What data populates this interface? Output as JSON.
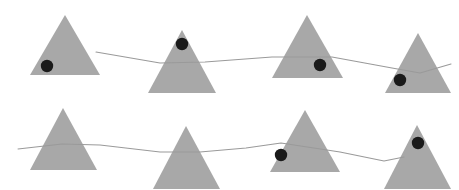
{
  "figure": {
    "title": "Triangles with path overlay",
    "width": 459,
    "height": 190,
    "background_color": "#ffffff"
  },
  "style": {
    "triangle_fill": "#a8a8a8",
    "triangle_stroke": "none",
    "dot_fill": "#1a1a1a",
    "path_stroke": "#9a9a9a",
    "path_width": 1.1,
    "dot_radius": 6.2
  },
  "shapes": {
    "triangles": [
      {
        "name": "triangle-row1-1",
        "row": 1,
        "index": 1,
        "apex_x": 65,
        "apex_y": 15,
        "base_left_x": 30,
        "base_right_x": 100,
        "base_y": 75
      },
      {
        "name": "triangle-row1-2",
        "row": 1,
        "index": 2,
        "apex_x": 182,
        "apex_y": 30,
        "base_left_x": 148,
        "base_right_x": 216,
        "base_y": 93
      },
      {
        "name": "triangle-row1-3",
        "row": 1,
        "index": 3,
        "apex_x": 307,
        "apex_y": 15,
        "base_left_x": 272,
        "base_right_x": 343,
        "base_y": 78
      },
      {
        "name": "triangle-row1-4",
        "row": 1,
        "index": 4,
        "apex_x": 418,
        "apex_y": 33,
        "base_left_x": 385,
        "base_right_x": 451,
        "base_y": 93
      },
      {
        "name": "triangle-row2-1",
        "row": 2,
        "index": 1,
        "apex_x": 63,
        "apex_y": 108,
        "base_left_x": 30,
        "base_right_x": 97,
        "base_y": 170
      },
      {
        "name": "triangle-row2-2",
        "row": 2,
        "index": 2,
        "apex_x": 186,
        "apex_y": 126,
        "base_left_x": 153,
        "base_right_x": 220,
        "base_y": 189
      },
      {
        "name": "triangle-row2-3",
        "row": 2,
        "index": 3,
        "apex_x": 305,
        "apex_y": 110,
        "base_left_x": 270,
        "base_right_x": 340,
        "base_y": 172
      },
      {
        "name": "triangle-row2-4",
        "row": 2,
        "index": 4,
        "apex_x": 417,
        "apex_y": 125,
        "base_left_x": 384,
        "base_right_x": 451,
        "base_y": 189
      }
    ],
    "dots": [
      {
        "name": "dot-row1-1",
        "row": 1,
        "triangle_index": 1,
        "cx": 47,
        "cy": 66
      },
      {
        "name": "dot-row1-2",
        "row": 1,
        "triangle_index": 2,
        "cx": 182,
        "cy": 44
      },
      {
        "name": "dot-row1-3",
        "row": 1,
        "triangle_index": 3,
        "cx": 320,
        "cy": 65
      },
      {
        "name": "dot-row1-4",
        "row": 1,
        "triangle_index": 4,
        "cx": 400,
        "cy": 80
      },
      {
        "name": "dot-row2-3",
        "row": 2,
        "triangle_index": 3,
        "cx": 281,
        "cy": 155
      },
      {
        "name": "dot-row2-4",
        "row": 2,
        "triangle_index": 4,
        "cx": 418,
        "cy": 143
      }
    ],
    "paths": [
      {
        "name": "path-row1",
        "row": 1,
        "points": [
          [
            96,
            52
          ],
          [
            160,
            63
          ],
          [
            205,
            62
          ],
          [
            272,
            57
          ],
          [
            332,
            57
          ],
          [
            392,
            68
          ],
          [
            420,
            73
          ],
          [
            451,
            64
          ]
        ]
      },
      {
        "name": "path-row2",
        "row": 2,
        "points": [
          [
            18,
            149
          ],
          [
            62,
            144
          ],
          [
            100,
            145
          ],
          [
            160,
            152
          ],
          [
            200,
            152
          ],
          [
            246,
            148
          ],
          [
            281,
            143
          ],
          [
            340,
            152
          ],
          [
            384,
            161
          ],
          [
            404,
            157
          ]
        ]
      }
    ]
  }
}
